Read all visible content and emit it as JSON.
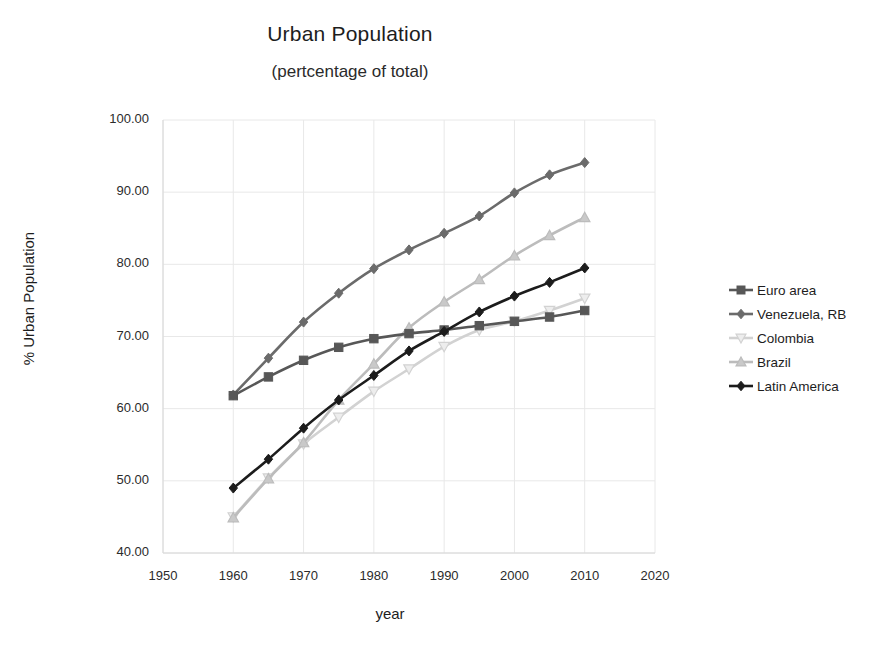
{
  "chart_data": {
    "type": "line",
    "title": "Urban Population",
    "subtitle": "(pertcentage of  total)",
    "xlabel": "year",
    "ylabel": "% Urban Population",
    "xlim": [
      1950,
      2020
    ],
    "ylim": [
      40,
      100
    ],
    "xticks": [
      "1950",
      "1960",
      "1970",
      "1980",
      "1990",
      "2000",
      "2010",
      "2020"
    ],
    "yticks": [
      "100.00",
      "90.00",
      "80.00",
      "70.00",
      "60.00",
      "50.00",
      "40.00"
    ],
    "grid": true,
    "legend_position": "right",
    "x": [
      1960,
      1965,
      1970,
      1975,
      1980,
      1985,
      1990,
      1995,
      2000,
      2005,
      2010
    ],
    "series": [
      {
        "name": "Euro area",
        "color": "#575757",
        "marker": "square",
        "marker_fill": "#575757",
        "values": [
          61.8,
          64.4,
          66.7,
          68.5,
          69.7,
          70.4,
          70.9,
          71.5,
          72.1,
          72.7,
          73.6
        ]
      },
      {
        "name": "Venezuela, RB",
        "color": "#6b6b6b",
        "marker": "diamond",
        "marker_fill": "#6b6b6b",
        "values": [
          61.9,
          67.0,
          72.0,
          76.0,
          79.4,
          82.0,
          84.3,
          86.7,
          89.9,
          92.4,
          94.1
        ]
      },
      {
        "name": "Colombia",
        "color": "#d2d2d2",
        "marker": "triangle-down",
        "marker_fill": "#ededed",
        "values": [
          45.0,
          50.4,
          55.1,
          58.8,
          62.4,
          65.5,
          68.6,
          70.9,
          72.1,
          73.6,
          75.3
        ]
      },
      {
        "name": "Brazil",
        "color": "#bcbcbc",
        "marker": "triangle-up",
        "marker_fill": "#c9c9c9",
        "values": [
          44.9,
          50.3,
          55.3,
          61.2,
          66.2,
          71.2,
          74.8,
          77.9,
          81.2,
          84.0,
          86.5
        ]
      },
      {
        "name": "Latin America",
        "color": "#1c1c1c",
        "marker": "diamond",
        "marker_fill": "#1c1c1c",
        "values": [
          49.0,
          53.0,
          57.3,
          61.2,
          64.6,
          68.0,
          70.7,
          73.4,
          75.6,
          77.5,
          79.5
        ]
      }
    ]
  }
}
